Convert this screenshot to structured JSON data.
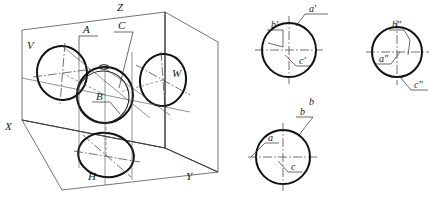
{
  "figure": {
    "background_color": "#ffffff",
    "line_color": "#111111",
    "thin_line_color": "#3a3a3a"
  },
  "isometric": {
    "name": "three-plane-projection-box",
    "axis_labels": {
      "z": "Z",
      "x": "X",
      "y": "Y"
    },
    "plane_labels": {
      "v": "V",
      "w": "W",
      "h": "H"
    },
    "point_labels": {
      "a": "A",
      "b": "B",
      "c": "C"
    }
  },
  "views": {
    "front": {
      "name": "front-view-v",
      "labels": {
        "a": "a'",
        "b": "b'",
        "c": "c'"
      },
      "view_letter": "b"
    },
    "side": {
      "name": "side-view-w",
      "labels": {
        "a": "a\"",
        "b": "b\"",
        "c": "c\""
      }
    },
    "top": {
      "name": "top-view-h",
      "labels": {
        "a": "a",
        "b": "b",
        "c": "c"
      }
    }
  }
}
